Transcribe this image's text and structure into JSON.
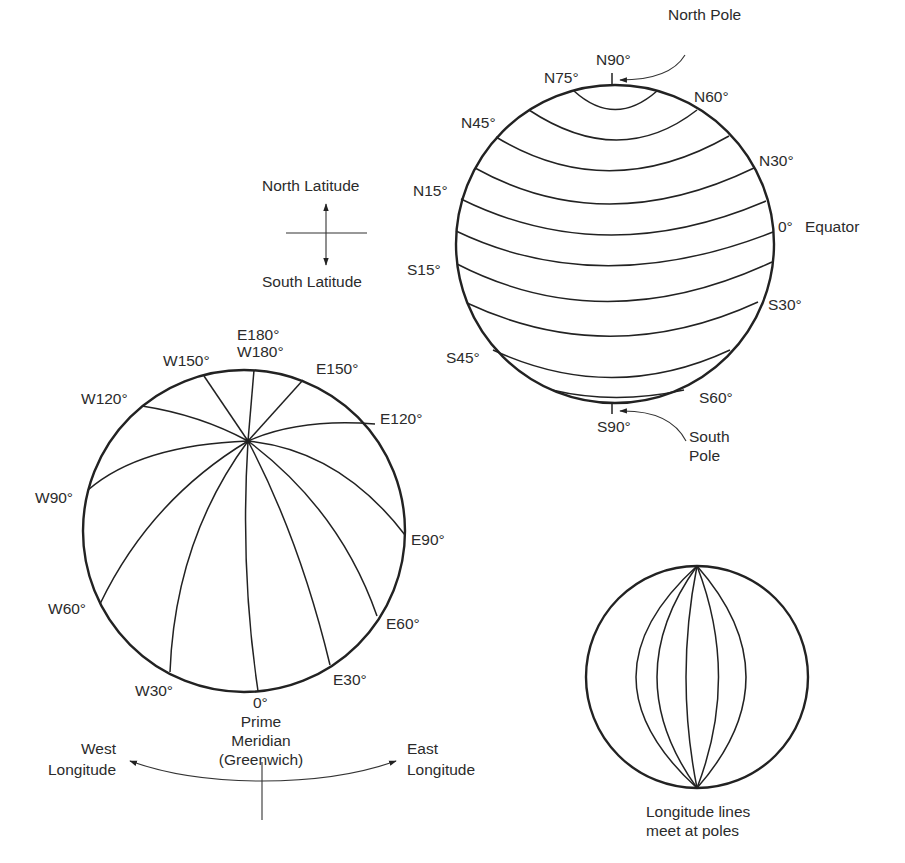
{
  "latitude_globe": {
    "north_pole_label": "North Pole",
    "south_pole_label": "South Pole",
    "labels": {
      "n90": "N90°",
      "n75": "N75°",
      "n60": "N60°",
      "n45": "N45°",
      "n30": "N30°",
      "n15": "N15°",
      "equator_deg": "0°",
      "equator_name": "Equator",
      "s15": "S15°",
      "s30": "S30°",
      "s45": "S45°",
      "s60": "S60°",
      "s90": "S90°"
    }
  },
  "latitude_legend": {
    "north": "North Latitude",
    "south": "South Latitude"
  },
  "longitude_globe": {
    "labels": {
      "e180": "E180°",
      "w180": "W180°",
      "w150": "W150°",
      "e150": "E150°",
      "w120": "W120°",
      "e120": "E120°",
      "w90": "W90°",
      "e90": "E90°",
      "w60": "W60°",
      "e60": "E60°",
      "w30": "W30°",
      "e30": "E30°",
      "zero": "0°"
    },
    "prime_meridian": [
      "Prime",
      "Meridian",
      "(Greenwich)"
    ]
  },
  "longitude_legend": {
    "west": [
      "West",
      "Longitude"
    ],
    "east": [
      "East",
      "Longitude"
    ]
  },
  "meridian_globe": {
    "caption": [
      "Longitude lines",
      "meet at poles"
    ]
  }
}
